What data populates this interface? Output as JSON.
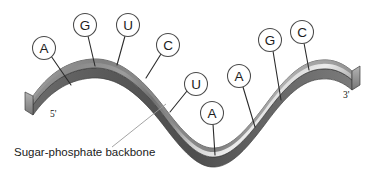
{
  "figure": {
    "background_color": "#ffffff",
    "width": 372,
    "height": 173
  },
  "backbone": {
    "label": "Sugar-phosphate backbone",
    "label_x": 14,
    "label_y": 156,
    "leader_from_x": 112,
    "leader_from_y": 147,
    "leader_to_x": 166,
    "leader_to_y": 104,
    "fill_top": "#8e8e8e",
    "fill_mid": "#b9b9b9",
    "fill_light": "#e4e4e4",
    "fill_dark": "#565656",
    "edge_color": "#3d3d3d"
  },
  "ends": {
    "five_prime": {
      "text": "5'",
      "x": 50,
      "y": 117
    },
    "three_prime": {
      "text": "3'",
      "x": 343,
      "y": 98
    }
  },
  "nucleotides": [
    {
      "base": "A",
      "cx": 44,
      "cy": 48,
      "r": 11.5,
      "line_x": 71,
      "line_y": 85
    },
    {
      "base": "G",
      "cx": 85,
      "cy": 25,
      "r": 11.5,
      "line_x": 95,
      "line_y": 66
    },
    {
      "base": "U",
      "cx": 128,
      "cy": 25,
      "r": 11.5,
      "line_x": 117,
      "line_y": 65
    },
    {
      "base": "C",
      "cx": 168,
      "cy": 45,
      "r": 11.5,
      "line_x": 146,
      "line_y": 78
    },
    {
      "base": "U",
      "cx": 196,
      "cy": 84,
      "r": 11.5,
      "line_x": 170,
      "line_y": 112
    },
    {
      "base": "A",
      "cx": 212,
      "cy": 113,
      "r": 11.5,
      "line_x": 215,
      "line_y": 155
    },
    {
      "base": "A",
      "cx": 239,
      "cy": 76,
      "r": 11.5,
      "line_x": 255,
      "line_y": 127
    },
    {
      "base": "G",
      "cx": 270,
      "cy": 40,
      "r": 11.5,
      "line_x": 281,
      "line_y": 100
    },
    {
      "base": "C",
      "cx": 302,
      "cy": 32,
      "r": 11.5,
      "line_x": 309,
      "line_y": 70
    }
  ],
  "colors": {
    "stroke": "#2b2b2b",
    "circle_stroke": "#4a4a4a",
    "text": "#1a1a1a",
    "thin_leader": "#9a9a9a"
  }
}
